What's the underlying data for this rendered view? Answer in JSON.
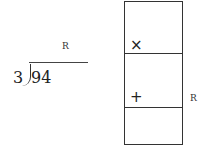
{
  "division": {
    "divisor": "3",
    "dividend": "94",
    "quotient_label": "R"
  },
  "box": {
    "cells": [
      {
        "symbol": "×"
      },
      {
        "symbol": "+"
      },
      {
        "symbol": ""
      }
    ],
    "side_label": "R"
  }
}
